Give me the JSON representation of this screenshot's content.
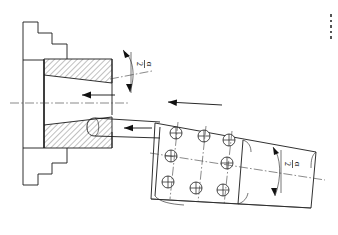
{
  "drawing": {
    "title": "Conical workpiece grinding setup",
    "background_color": "#ffffff",
    "line_color": "#1a1a1a",
    "canvas": {
      "width": 338,
      "height": 235
    }
  },
  "labels": {
    "angle_top": {
      "symbol": "α",
      "denominator": "2",
      "text": "α/2",
      "rotation_deg": 90
    },
    "angle_right": {
      "symbol": "α",
      "denominator": "2",
      "text": "α/2",
      "rotation_deg": 90
    }
  },
  "parts": {
    "chuck": {
      "name": "stepped-chuck-fixture",
      "description": "stepped fixture profile at left"
    },
    "workpiece": {
      "name": "conical-workpiece",
      "description": "hatched tapered sleeve in section"
    },
    "tool_shank": {
      "name": "cylindrical-tool-shank",
      "description": "cylindrical arbor leaving chuck bore"
    },
    "grinding_block": {
      "name": "grinding-tool-body",
      "description": "angled prismatic tool body with coolant holes"
    }
  },
  "holes": {
    "count": 9,
    "label": "coolant-hole",
    "radius": 6.0,
    "positions": [
      {
        "cx": 176,
        "cy": 133
      },
      {
        "cx": 204,
        "cy": 136
      },
      {
        "cx": 229,
        "cy": 140
      },
      {
        "cx": 171,
        "cy": 156
      },
      {
        "cx": 227,
        "cy": 163
      },
      {
        "cx": 168,
        "cy": 182
      },
      {
        "cx": 196,
        "cy": 188
      },
      {
        "cx": 223,
        "cy": 190
      }
    ]
  },
  "arrows": {
    "axial_feed": {
      "name": "axial-feed-arrow",
      "direction": "left"
    },
    "tool_feed": {
      "name": "tool-feed-arrow",
      "direction": "left"
    },
    "block_feed": {
      "name": "block-feed-arrow",
      "direction": "left"
    },
    "rotation_top": {
      "name": "rotation-arc-top",
      "direction": "double"
    },
    "rotation_right": {
      "name": "rotation-arc-right",
      "direction": "double"
    }
  },
  "hatching": {
    "angle_deg": 45,
    "spacing_px": 4,
    "color": "#1a1a1a"
  }
}
